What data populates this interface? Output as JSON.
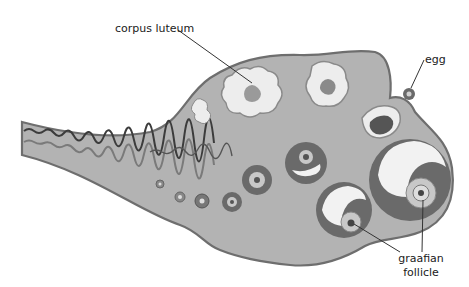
{
  "diagram": {
    "colors": {
      "ovary_fill": "#b3b3b3",
      "ovary_outline": "#6e6e6e",
      "follicle_ring": "#6a6a6a",
      "follicle_cavity": "#f2f2f2",
      "corpus_fill": "#ededed",
      "vessel_dark": "#3c3c3c",
      "vessel_mid": "#7a7a7a",
      "leader_line": "#333333"
    },
    "labels": {
      "corpus_luteum": "corpus luteum",
      "egg": "egg",
      "graafian_line1": "graafian",
      "graafian_line2": "follicle"
    }
  }
}
